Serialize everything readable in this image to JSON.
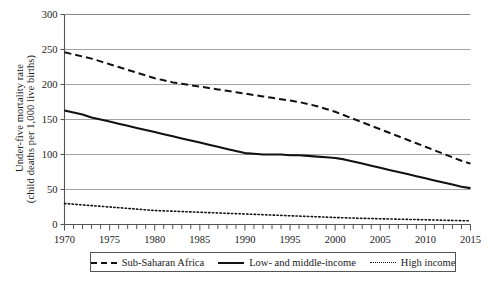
{
  "chart_data": {
    "type": "line",
    "title": "",
    "xlabel": "",
    "ylabel": "Under-five mortality rate (child deaths per 1,000 live births)",
    "ylabel_line1": "Under-five mortality rate",
    "ylabel_line2": "(child deaths per 1,000 live births)",
    "xlim": [
      1970,
      2015
    ],
    "ylim": [
      0,
      300
    ],
    "ytick_step": 50,
    "xtick_step_major": 5,
    "xtick_step_minor": 1,
    "grid": "horizontal",
    "legend_position": "bottom",
    "yticks": [
      "0",
      "50",
      "100",
      "150",
      "200",
      "250",
      "300"
    ],
    "xticks": [
      "1970",
      "1975",
      "1980",
      "1985",
      "1990",
      "1995",
      "2000",
      "2005",
      "2010",
      "2015"
    ],
    "x": [
      1970,
      1971,
      1972,
      1973,
      1974,
      1975,
      1976,
      1977,
      1978,
      1979,
      1980,
      1981,
      1982,
      1983,
      1984,
      1985,
      1986,
      1987,
      1988,
      1989,
      1990,
      1991,
      1992,
      1993,
      1994,
      1995,
      1996,
      1997,
      1998,
      1999,
      2000,
      2001,
      2002,
      2003,
      2004,
      2005,
      2006,
      2007,
      2008,
      2009,
      2010,
      2011,
      2012,
      2013,
      2014,
      2015
    ],
    "series": [
      {
        "name": "Sub-Saharan Africa",
        "style": "dashed",
        "color": "#111111",
        "values": [
          246,
          243,
          240,
          237,
          233,
          229,
          225,
          221,
          217,
          213,
          209,
          206,
          203,
          201,
          199,
          197,
          195,
          193,
          191,
          189,
          187,
          185,
          183,
          181,
          179,
          177,
          175,
          172,
          169,
          165,
          161,
          156,
          151,
          146,
          141,
          136,
          131,
          126,
          121,
          116,
          111,
          106,
          101,
          96,
          91,
          87
        ]
      },
      {
        "name": "Low- and middle-income",
        "style": "solid",
        "color": "#111111",
        "values": [
          163,
          160,
          157,
          153,
          150,
          147,
          144,
          141,
          138,
          135,
          132,
          129,
          126,
          123,
          120,
          117,
          114,
          111,
          108,
          105,
          102,
          101,
          100,
          100,
          100,
          99,
          99,
          98,
          97,
          96,
          95,
          93,
          90,
          87,
          84,
          81,
          78,
          75,
          72,
          69,
          66,
          63,
          60,
          57,
          54,
          52
        ]
      },
      {
        "name": "High income",
        "style": "dotted",
        "color": "#111111",
        "values": [
          30,
          29,
          28,
          27,
          26,
          25,
          24,
          23,
          22,
          21,
          20,
          19.5,
          19,
          18.5,
          18,
          17.5,
          17,
          16.5,
          16,
          15.5,
          15,
          14.5,
          14,
          13.5,
          13,
          12.5,
          12,
          11.5,
          11,
          10.5,
          10,
          9.6,
          9.2,
          8.8,
          8.5,
          8.2,
          7.9,
          7.6,
          7.3,
          7,
          6.7,
          6.4,
          6.1,
          5.8,
          5.5,
          5.2
        ]
      }
    ]
  },
  "legend": {
    "items": [
      {
        "label": "Sub-Saharan Africa",
        "style": "dashed"
      },
      {
        "label": "Low- and middle-income",
        "style": "solid"
      },
      {
        "label": "High income",
        "style": "dotted"
      }
    ]
  }
}
